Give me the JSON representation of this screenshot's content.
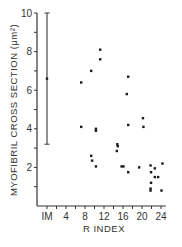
{
  "chart_data": {
    "type": "scatter",
    "title": "",
    "xlabel": "R INDEX",
    "ylabel": "MYOFIBRIL CROSS SECTION (μm²)",
    "xlim": [
      0,
      25
    ],
    "ylim": [
      0,
      10
    ],
    "grid": false,
    "x_ticks": [
      {
        "value": 0,
        "label": "IM"
      },
      {
        "value": 4,
        "label": "4"
      },
      {
        "value": 8,
        "label": "8"
      },
      {
        "value": 12,
        "label": "12"
      },
      {
        "value": 16,
        "label": "16"
      },
      {
        "value": 20,
        "label": "20"
      },
      {
        "value": 24,
        "label": "24"
      }
    ],
    "y_ticks": [
      {
        "value": 2,
        "label": "2"
      },
      {
        "value": 4,
        "label": "4"
      },
      {
        "value": 6,
        "label": "6"
      },
      {
        "value": 8,
        "label": "8"
      },
      {
        "value": 10,
        "label": "10"
      }
    ],
    "im_range": {
      "x": 0,
      "label": "IM",
      "min": 3.2,
      "mean": 6.6,
      "max": 10.0
    },
    "points": [
      {
        "x": 7.2,
        "y": 6.4
      },
      {
        "x": 7.2,
        "y": 4.1
      },
      {
        "x": 9.3,
        "y": 7.0
      },
      {
        "x": 9.3,
        "y": 2.6
      },
      {
        "x": 9.5,
        "y": 2.35
      },
      {
        "x": 10.3,
        "y": 4.0
      },
      {
        "x": 10.3,
        "y": 3.9
      },
      {
        "x": 10.3,
        "y": 2.05
      },
      {
        "x": 11.2,
        "y": 8.1
      },
      {
        "x": 11.2,
        "y": 7.6
      },
      {
        "x": 14.7,
        "y": 2.85
      },
      {
        "x": 14.8,
        "y": 3.2
      },
      {
        "x": 14.9,
        "y": 3.1
      },
      {
        "x": 15.7,
        "y": 2.05
      },
      {
        "x": 16.1,
        "y": 2.05
      },
      {
        "x": 16.8,
        "y": 5.8
      },
      {
        "x": 17.1,
        "y": 6.7
      },
      {
        "x": 17.1,
        "y": 4.2
      },
      {
        "x": 17.1,
        "y": 1.75
      },
      {
        "x": 19.4,
        "y": 2.0
      },
      {
        "x": 20.2,
        "y": 4.55
      },
      {
        "x": 20.3,
        "y": 4.1
      },
      {
        "x": 21.8,
        "y": 2.1
      },
      {
        "x": 21.9,
        "y": 1.75
      },
      {
        "x": 21.9,
        "y": 1.2
      },
      {
        "x": 21.8,
        "y": 0.9
      },
      {
        "x": 21.8,
        "y": 0.8
      },
      {
        "x": 22.7,
        "y": 1.95
      },
      {
        "x": 22.7,
        "y": 1.5
      },
      {
        "x": 23.4,
        "y": 1.5
      },
      {
        "x": 24.1,
        "y": 0.8
      },
      {
        "x": 24.3,
        "y": 2.2
      }
    ]
  },
  "colors": {
    "axis": "#333333",
    "points": "#1a1a1a",
    "range_bar": "#555555"
  }
}
